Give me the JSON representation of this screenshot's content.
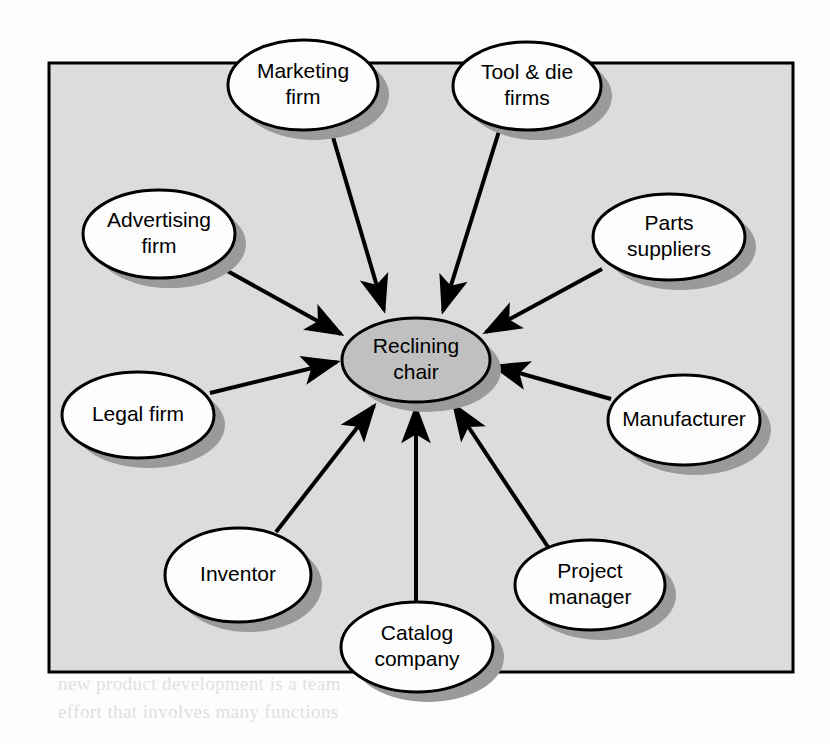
{
  "figure": {
    "kind": "network-diagram",
    "frame": {
      "x": 49,
      "y": 63,
      "width": 744,
      "height": 609,
      "fill": "#dcdcdc",
      "stroke": "#000000"
    },
    "page_background": "#fdfdfd",
    "shadow_color": "#9a9a9a"
  },
  "center_node": {
    "id": "reclining-chair",
    "label_lines": [
      "Reclining",
      "chair"
    ],
    "cx": 416,
    "cy": 360,
    "rx": 74,
    "ry": 42,
    "fill": "#c0c0c0",
    "stroke": "#000000"
  },
  "nodes": [
    {
      "id": "marketing-firm",
      "label_lines": [
        "Marketing",
        "firm"
      ],
      "cx": 303,
      "cy": 85,
      "rx": 75,
      "ry": 45,
      "fill": "#fdfdfd",
      "stroke": "#000000"
    },
    {
      "id": "tool-and-die-firms",
      "label_lines": [
        "Tool & die",
        "firms"
      ],
      "cx": 527,
      "cy": 86,
      "rx": 74,
      "ry": 44,
      "fill": "#fdfdfd",
      "stroke": "#000000"
    },
    {
      "id": "advertising-firm",
      "label_lines": [
        "Advertising",
        "firm"
      ],
      "cx": 159,
      "cy": 234,
      "rx": 76,
      "ry": 44,
      "fill": "#fdfdfd",
      "stroke": "#000000"
    },
    {
      "id": "parts-suppliers",
      "label_lines": [
        "Parts",
        "suppliers"
      ],
      "cx": 669,
      "cy": 237,
      "rx": 76,
      "ry": 43,
      "fill": "#fdfdfd",
      "stroke": "#000000"
    },
    {
      "id": "legal-firm",
      "label_lines": [
        "Legal firm"
      ],
      "cx": 138,
      "cy": 415,
      "rx": 76,
      "ry": 43,
      "fill": "#fdfdfd",
      "stroke": "#000000"
    },
    {
      "id": "manufacturer",
      "label_lines": [
        "Manufacturer"
      ],
      "cx": 684,
      "cy": 420,
      "rx": 76,
      "ry": 45,
      "fill": "#fdfdfd",
      "stroke": "#000000"
    },
    {
      "id": "inventor",
      "label_lines": [
        "Inventor"
      ],
      "cx": 238,
      "cy": 575,
      "rx": 73,
      "ry": 47,
      "fill": "#fdfdfd",
      "stroke": "#000000"
    },
    {
      "id": "project-manager",
      "label_lines": [
        "Project",
        "manager"
      ],
      "cx": 590,
      "cy": 585,
      "rx": 75,
      "ry": 45,
      "fill": "#fdfdfd",
      "stroke": "#000000"
    },
    {
      "id": "catalog-company",
      "label_lines": [
        "Catalog",
        "company"
      ],
      "cx": 417,
      "cy": 647,
      "rx": 76,
      "ry": 45,
      "fill": "#fdfdfd",
      "stroke": "#000000"
    }
  ],
  "edges": [
    {
      "id": "edge-marketing-firm",
      "from": "marketing-firm",
      "to": "reclining-chair",
      "x1": 330,
      "y1": 127,
      "x2": 384,
      "y2": 310
    },
    {
      "id": "edge-tool-and-die-firms",
      "from": "tool-and-die-firms",
      "to": "reclining-chair",
      "x1": 500,
      "y1": 128,
      "x2": 443,
      "y2": 311
    },
    {
      "id": "edge-advertising-firm",
      "from": "advertising-firm",
      "to": "reclining-chair",
      "x1": 222,
      "y1": 268,
      "x2": 341,
      "y2": 334
    },
    {
      "id": "edge-parts-suppliers",
      "from": "parts-suppliers",
      "to": "reclining-chair",
      "x1": 602,
      "y1": 269,
      "x2": 486,
      "y2": 332
    },
    {
      "id": "edge-legal-firm",
      "from": "legal-firm",
      "to": "reclining-chair",
      "x1": 210,
      "y1": 393,
      "x2": 337,
      "y2": 362
    },
    {
      "id": "edge-manufacturer",
      "from": "manufacturer",
      "to": "reclining-chair",
      "x1": 611,
      "y1": 399,
      "x2": 494,
      "y2": 366
    },
    {
      "id": "edge-inventor",
      "from": "inventor",
      "to": "reclining-chair",
      "x1": 276,
      "y1": 532,
      "x2": 374,
      "y2": 406
    },
    {
      "id": "edge-project-manager",
      "from": "project-manager",
      "to": "reclining-chair",
      "x1": 548,
      "y1": 547,
      "x2": 454,
      "y2": 405
    },
    {
      "id": "edge-catalog-company",
      "from": "catalog-company",
      "to": "reclining-chair",
      "x1": 416,
      "y1": 604,
      "x2": 416,
      "y2": 408
    }
  ],
  "ghost_text": {
    "note": "faint show-through of body text from reverse side of the printed page",
    "lines": [
      {
        "x": 58,
        "y": 250,
        "text": "but is not the same as it. Product design"
      },
      {
        "x": 58,
        "y": 278,
        "text": "and its method of production with the"
      },
      {
        "x": 58,
        "y": 306,
        "text": "manufacturing process is needed"
      },
      {
        "x": 58,
        "y": 378,
        "text": "can be the key to a successful launch"
      },
      {
        "x": 58,
        "y": 406,
        "text": "of the new product in the market"
      },
      {
        "x": 58,
        "y": 492,
        "text": "is important to consider how the"
      },
      {
        "x": 58,
        "y": 520,
        "text": "design is to be manufactured"
      },
      {
        "x": 58,
        "y": 548,
        "text": "the design team must work with"
      },
      {
        "x": 58,
        "y": 576,
        "text": "suppliers and the manufacturer"
      },
      {
        "x": 58,
        "y": 604,
        "text": "to ensure the design is producible"
      },
      {
        "x": 58,
        "y": 690,
        "text": "new product development is a team"
      },
      {
        "x": 58,
        "y": 718,
        "text": "effort that involves many functions"
      }
    ]
  }
}
